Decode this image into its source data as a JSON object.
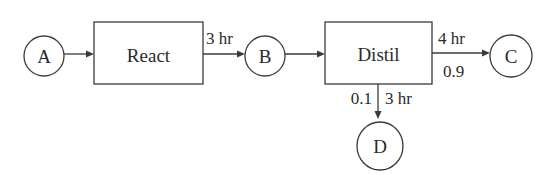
{
  "diagram": {
    "type": "process-flow",
    "nodes": {
      "A": {
        "label": "A",
        "shape": "circle"
      },
      "react": {
        "label": "React",
        "shape": "rectangle"
      },
      "B": {
        "label": "B",
        "shape": "circle"
      },
      "distil": {
        "label": "Distil",
        "shape": "rectangle"
      },
      "C": {
        "label": "C",
        "shape": "circle"
      },
      "D": {
        "label": "D",
        "shape": "circle"
      }
    },
    "edges": {
      "a_to_react": {
        "from": "A",
        "to": "React"
      },
      "react_to_b": {
        "from": "React",
        "to": "B",
        "time": "3 hr"
      },
      "b_to_distil": {
        "from": "B",
        "to": "Distil"
      },
      "distil_to_c": {
        "from": "Distil",
        "to": "C",
        "time": "4 hr",
        "fraction": "0.9"
      },
      "distil_to_d": {
        "from": "Distil",
        "to": "D",
        "time": "3 hr",
        "fraction": "0.1"
      }
    }
  }
}
